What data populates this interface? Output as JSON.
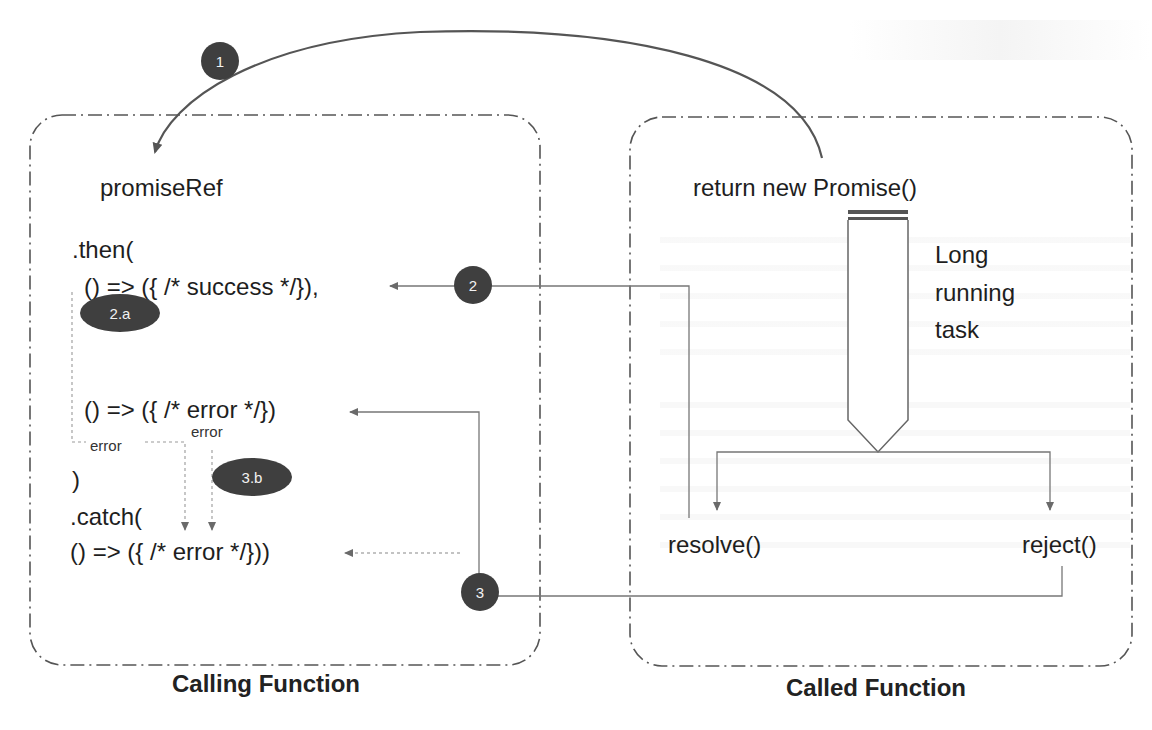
{
  "diagram": {
    "calling_function": {
      "caption": "Calling Function",
      "code_lines": {
        "promise_ref": "promiseRef",
        "then_open": ".then(",
        "success_handler": "() => ({ /* success */}),",
        "error_handler": "() => ({ /* error */})",
        "then_close": ")",
        "catch_open": ".catch(",
        "catch_handler": "() => ({ /* error */}))"
      },
      "error_labels": [
        "error",
        "error"
      ]
    },
    "called_function": {
      "caption": "Called Function",
      "return_statement": "return new Promise()",
      "task_label": [
        "Long",
        "running",
        "task"
      ],
      "outcomes": {
        "resolve": "resolve()",
        "reject": "reject()"
      }
    },
    "steps": [
      {
        "id": "1",
        "label": "1"
      },
      {
        "id": "2",
        "label": "2"
      },
      {
        "id": "2a",
        "label": "2.a"
      },
      {
        "id": "3",
        "label": "3"
      },
      {
        "id": "3b",
        "label": "3.b"
      }
    ],
    "colors": {
      "badge_fill": "#3f3f3f",
      "badge_text": "#f2f2f2",
      "line": "#7a7a7a",
      "curve": "#555555",
      "border": "#555555"
    }
  }
}
